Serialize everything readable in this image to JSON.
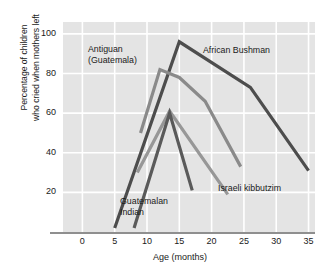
{
  "chart_data": {
    "type": "line",
    "title": "",
    "xlabel": "Age (months)",
    "ylabel": "Percentage of children who cried when mothers left",
    "ylabel_line1": "Percentage of children",
    "ylabel_line2": "who cried when mothers left",
    "xlim": [
      -3,
      36
    ],
    "ylim": [
      0,
      106
    ],
    "xticks": [
      0,
      5,
      10,
      15,
      20,
      25,
      30,
      35
    ],
    "yticks": [
      20,
      40,
      60,
      80,
      100
    ],
    "grid": true,
    "legend_position": "inline-annotations",
    "series": [
      {
        "name": "African Bushman",
        "color": "#4d4d4d",
        "label_lines": [
          "African Bushman"
        ],
        "points": [
          [
            5,
            2
          ],
          [
            15,
            96
          ],
          [
            26,
            73
          ],
          [
            35,
            31
          ]
        ]
      },
      {
        "name": "Antiguan (Guatemala)",
        "color": "#8a8a8a",
        "label_lines": [
          "Antiguan",
          "(Guatemala)"
        ],
        "points": [
          [
            9,
            50
          ],
          [
            12,
            82
          ],
          [
            15,
            78
          ],
          [
            19,
            66
          ],
          [
            24.5,
            33
          ]
        ]
      },
      {
        "name": "Israeli kibbutzim",
        "color": "#979797",
        "label_lines": [
          "Israeli kibbutzim"
        ],
        "points": [
          [
            8.5,
            30
          ],
          [
            13.5,
            61
          ],
          [
            22.5,
            19
          ]
        ]
      },
      {
        "name": "Guatemalan Indian",
        "color": "#5a5a5a",
        "label_lines": [
          "Guatemalan",
          "Indian"
        ],
        "points": [
          [
            8,
            2
          ],
          [
            13.5,
            60
          ],
          [
            17,
            21
          ]
        ]
      }
    ]
  }
}
